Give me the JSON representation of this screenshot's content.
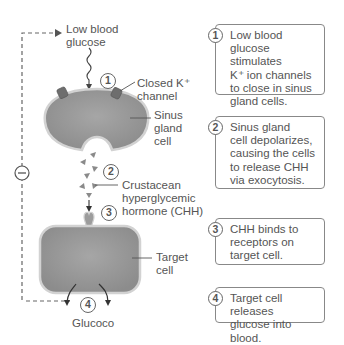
{
  "diagram": {
    "labels": {
      "low_blood_glucose_line1": "Low blood",
      "low_blood_glucose_line2": "glucose",
      "closed_k_channel_line1": "Closed K⁺",
      "closed_k_channel_line2": "channel",
      "sinus_gland_cell_line1": "Sinus",
      "sinus_gland_cell_line2": "gland",
      "sinus_gland_cell_line3": "cell",
      "chh_line1": "Crustacean",
      "chh_line2": "hyperglycemic",
      "chh_line3": "hormone (CHH)",
      "target_cell_line1": "Target",
      "target_cell_line2": "cell",
      "glucose_output": "Glucoco",
      "negative_feedback": "−"
    },
    "markers": [
      "1",
      "2",
      "3",
      "4"
    ],
    "colors": {
      "cell_fill": "#9a9a9a",
      "cell_border": "#d0d0d0",
      "channel": "#6a6a6a",
      "hormone": "#8a8a8a",
      "line": "#555555"
    }
  },
  "steps": [
    {
      "num": "1",
      "lines": [
        "Low blood",
        "glucose stimulates",
        "K⁺ ion channels",
        "to close in sinus",
        "gland cells."
      ]
    },
    {
      "num": "2",
      "lines": [
        "Sinus gland",
        "cell depolarizes,",
        "causing the cells",
        "to release CHH",
        "via exocytosis."
      ]
    },
    {
      "num": "3",
      "lines": [
        "CHH binds to",
        "receptors on",
        "target cell."
      ]
    },
    {
      "num": "4",
      "lines": [
        "Target cell releases",
        "glucose into blood."
      ]
    }
  ]
}
